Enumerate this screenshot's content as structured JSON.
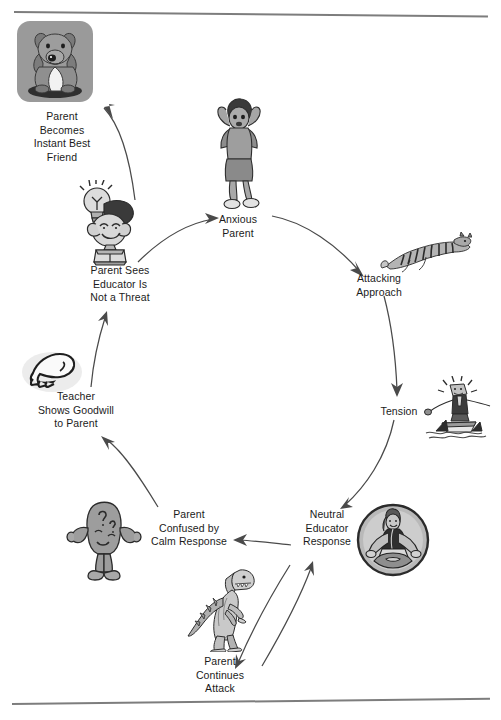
{
  "figure": {
    "background_color": "#ffffff",
    "line_color": "#4a4a4a",
    "rule_color": "#7d7d7d",
    "plaque_color": "#9a9a9a"
  },
  "nodes": [
    {
      "id": "parent-becomes-instant-best-friend",
      "label": "Parent\nBecomes\nInstant Best\nFriend",
      "icon": "puppy-dog-icon",
      "x": 14,
      "y": 110,
      "width": 96
    },
    {
      "id": "anxious-parent",
      "label": "Anxious\nParent",
      "icon": "anxious-woman-icon",
      "x": 201,
      "y": 213,
      "width": 74
    },
    {
      "id": "attacking-approach",
      "label": "Attacking\nApproach",
      "icon": "leaping-tiger-icon",
      "x": 340,
      "y": 272,
      "width": 78
    },
    {
      "id": "tension",
      "label": "Tension",
      "icon": "man-on-raft-with-sharks-icon",
      "x": 368,
      "y": 405,
      "width": 62
    },
    {
      "id": "neutral-educator-response",
      "label": "Neutral\nEducator\nResponse",
      "icon": "meditating-woman-icon",
      "x": 294,
      "y": 508,
      "width": 66
    },
    {
      "id": "parent-continues-attack",
      "label": "Parent\nContinues\nAttack",
      "icon": "tyrannosaurus-icon",
      "x": 184,
      "y": 655,
      "width": 72
    },
    {
      "id": "parent-confused-by-calm-response",
      "label": "Parent\nConfused by\nCalm Response",
      "icon": "confused-blob-icon",
      "x": 143,
      "y": 508,
      "width": 92
    },
    {
      "id": "teacher-shows-goodwill-to-parent",
      "label": "Teacher\nShows Goodwill\nto Parent",
      "icon": "open-hand-icon",
      "x": 28,
      "y": 390,
      "width": 96
    },
    {
      "id": "parent-sees-educator-is-not-a-threat",
      "label": "Parent Sees\nEducator Is\nNot a Threat",
      "icon": "lightbulb-head-figure-icon",
      "x": 78,
      "y": 264,
      "width": 84
    }
  ],
  "edges": [
    {
      "from": "parent-sees-educator-is-not-a-threat",
      "to": "parent-becomes-instant-best-friend",
      "direction": "one-way"
    },
    {
      "from": "parent-sees-educator-is-not-a-threat",
      "to": "anxious-parent",
      "direction": "one-way"
    },
    {
      "from": "anxious-parent",
      "to": "attacking-approach",
      "direction": "one-way"
    },
    {
      "from": "attacking-approach",
      "to": "tension",
      "direction": "one-way"
    },
    {
      "from": "tension",
      "to": "neutral-educator-response",
      "direction": "one-way"
    },
    {
      "from": "neutral-educator-response",
      "to": "parent-confused-by-calm-response",
      "direction": "one-way"
    },
    {
      "from": "neutral-educator-response",
      "to": "parent-continues-attack",
      "direction": "two-way"
    },
    {
      "from": "parent-confused-by-calm-response",
      "to": "teacher-shows-goodwill-to-parent",
      "direction": "one-way"
    },
    {
      "from": "teacher-shows-goodwill-to-parent",
      "to": "parent-sees-educator-is-not-a-threat",
      "direction": "one-way"
    }
  ]
}
